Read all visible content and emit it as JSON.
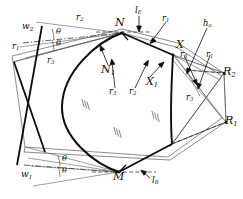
{
  "figure": {
    "background_color": "#ffffff",
    "ink_color": "#0d0d0d",
    "thin_color": "#555555"
  },
  "points": {
    "N": "N",
    "N1": "N",
    "N1_sub": "1",
    "M": "M",
    "X": "X",
    "X1": "X",
    "X1_sub": "1",
    "R1": "R",
    "R1_sub": "1",
    "R2": "R",
    "R2_sub": "2"
  },
  "radii": {
    "r1_topleft": "r",
    "r1_topleft_sub": "1",
    "r2_topleft": "r",
    "r2_topleft_sub": "2",
    "r3_topleft": "r",
    "r3_topleft_sub": "3",
    "r1_topright": "r",
    "r1_topright_sub": "1",
    "r3_center": "r",
    "r3_center_sub": "3",
    "r2_center": "r",
    "r2_center_sub": "2",
    "r3_right": "r",
    "r3_right_sub": "3",
    "r1_right": "r",
    "r1_right_sub": "1",
    "r3_lower_right": "r",
    "r3_lower_right_sub": "3"
  },
  "angles": {
    "theta_top_upper": "θ",
    "theta_top_lower": "θ",
    "theta_bottom_upper": "θ",
    "theta_bottom_lower": "θ"
  },
  "widths": {
    "w1": "w",
    "w1_sub": "1",
    "w2": "w",
    "w2_sub": "2"
  },
  "heights": {
    "ha": "h",
    "ha_sub": "a"
  },
  "lines": {
    "lE": "l",
    "lE_sub": "E",
    "lB": "l",
    "lB_sub": "B"
  },
  "hatch_marks": {
    "symbol": "⁂",
    "count": 3,
    "note": "section hatch marks inside body"
  }
}
